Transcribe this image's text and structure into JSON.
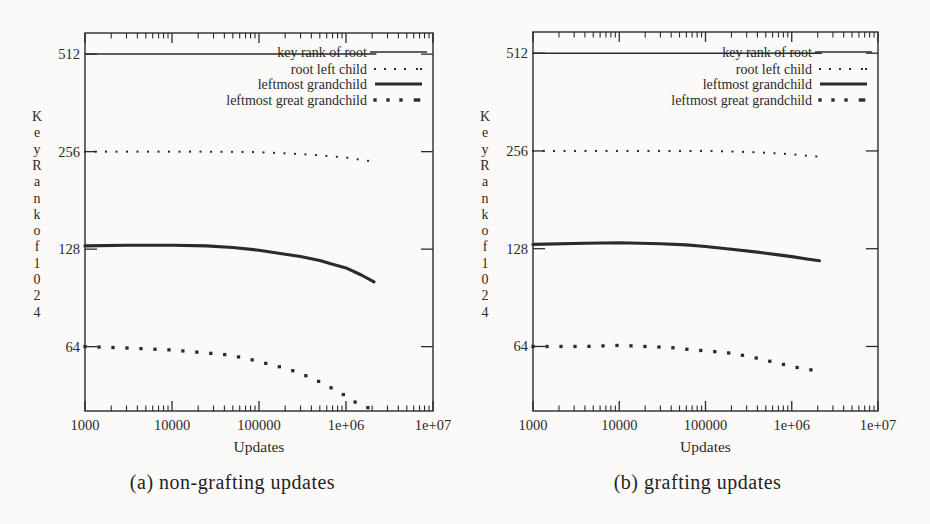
{
  "figure": {
    "background": "#fbfaf8",
    "ink": "#2b2b2b"
  },
  "chart_data": [
    {
      "type": "line",
      "caption": "(a) non-grafting updates",
      "xlabel": "Updates",
      "ylabel": "Key Rank of 1024",
      "x_scale": "log10",
      "y_scale": "log2",
      "xlim": [
        1000,
        10000000
      ],
      "ylim": [
        40.5,
        595
      ],
      "grid": false,
      "legend_position": "top-right-inside",
      "x_ticks": [
        {
          "v": 1000,
          "label": "1000"
        },
        {
          "v": 10000,
          "label": "10000"
        },
        {
          "v": 100000,
          "label": "100000"
        },
        {
          "v": 1000000,
          "label": "1e+06"
        },
        {
          "v": 10000000,
          "label": "1e+07"
        }
      ],
      "y_ticks": [
        {
          "v": 512,
          "label": "512"
        },
        {
          "v": 256,
          "label": "256"
        },
        {
          "v": 128,
          "label": "128"
        },
        {
          "v": 64,
          "label": "64"
        }
      ],
      "series": [
        {
          "name": "key rank of root",
          "style": "line-thin",
          "points": [
            [
              1000,
              512
            ],
            [
              2200000,
              512
            ]
          ]
        },
        {
          "name": "root left child",
          "style": "dots-small",
          "points": [
            [
              1000,
              256
            ],
            [
              20000,
              256
            ],
            [
              60000,
              255.5
            ],
            [
              100000,
              255
            ],
            [
              200000,
              253
            ],
            [
              400000,
              250.5
            ],
            [
              700000,
              247.5
            ],
            [
              1000000,
              245.5
            ],
            [
              1500000,
              241.5
            ],
            [
              2200000,
              238
            ]
          ]
        },
        {
          "name": "leftmost grandchild",
          "style": "line-thick",
          "points": [
            [
              1000,
              131
            ],
            [
              3000,
              131.5
            ],
            [
              10000,
              131.5
            ],
            [
              25000,
              131
            ],
            [
              50000,
              129.5
            ],
            [
              100000,
              127
            ],
            [
              200000,
              123.5
            ],
            [
              300000,
              121.5
            ],
            [
              500000,
              118
            ],
            [
              700000,
              115
            ],
            [
              1000000,
              112
            ],
            [
              1500000,
              106.5
            ],
            [
              2100000,
              101.5
            ]
          ]
        },
        {
          "name": "leftmost great grandchild",
          "style": "dots-large",
          "points": [
            [
              1000,
              64
            ],
            [
              2500,
              63.5
            ],
            [
              5000,
              63
            ],
            [
              10000,
              62.5
            ],
            [
              20000,
              61.5
            ],
            [
              40000,
              60.5
            ],
            [
              70000,
              59
            ],
            [
              100000,
              57.5
            ],
            [
              150000,
              56
            ],
            [
              220000,
              54.5
            ],
            [
              320000,
              52.5
            ],
            [
              450000,
              50.5
            ],
            [
              650000,
              48
            ],
            [
              900000,
              45.8
            ],
            [
              1200000,
              43.5
            ],
            [
              1600000,
              41.8
            ],
            [
              2100000,
              41
            ]
          ]
        }
      ]
    },
    {
      "type": "line",
      "caption": "(b) grafting updates",
      "xlabel": "Updates",
      "ylabel": "Key Rank of 1024",
      "x_scale": "log10",
      "y_scale": "log2",
      "xlim": [
        1000,
        10000000
      ],
      "ylim": [
        40.5,
        595
      ],
      "grid": false,
      "legend_position": "top-right-inside",
      "x_ticks": [
        {
          "v": 1000,
          "label": "1000"
        },
        {
          "v": 10000,
          "label": "10000"
        },
        {
          "v": 100000,
          "label": "100000"
        },
        {
          "v": 1000000,
          "label": "1e+06"
        },
        {
          "v": 10000000,
          "label": "1e+07"
        }
      ],
      "y_ticks": [
        {
          "v": 512,
          "label": "512"
        },
        {
          "v": 256,
          "label": "256"
        },
        {
          "v": 128,
          "label": "128"
        },
        {
          "v": 64,
          "label": "64"
        }
      ],
      "series": [
        {
          "name": "key rank of root",
          "style": "line-thin",
          "points": [
            [
              1000,
              512
            ],
            [
              2200000,
              512
            ]
          ]
        },
        {
          "name": "root left child",
          "style": "dots-small",
          "points": [
            [
              1000,
              256
            ],
            [
              100000,
              256
            ],
            [
              200000,
              255
            ],
            [
              400000,
              253.5
            ],
            [
              700000,
              251.5
            ],
            [
              1000000,
              250
            ],
            [
              1500000,
              247.5
            ],
            [
              2200000,
              245.5
            ]
          ]
        },
        {
          "name": "leftmost grandchild",
          "style": "line-thick",
          "points": [
            [
              1000,
              132
            ],
            [
              4000,
              133
            ],
            [
              10000,
              133.5
            ],
            [
              30000,
              132.5
            ],
            [
              60000,
              131.5
            ],
            [
              100000,
              130
            ],
            [
              200000,
              127.5
            ],
            [
              400000,
              125
            ],
            [
              700000,
              122.5
            ],
            [
              1000000,
              121
            ],
            [
              1500000,
              119
            ],
            [
              2100000,
              117.5
            ]
          ]
        },
        {
          "name": "leftmost great grandchild",
          "style": "dots-large",
          "points": [
            [
              1000,
              64
            ],
            [
              4000,
              64
            ],
            [
              10000,
              64.5
            ],
            [
              20000,
              64
            ],
            [
              40000,
              63.5
            ],
            [
              70000,
              62.5
            ],
            [
              120000,
              61.8
            ],
            [
              200000,
              61
            ],
            [
              300000,
              59.8
            ],
            [
              450000,
              58.5
            ],
            [
              650000,
              57
            ],
            [
              900000,
              56
            ],
            [
              1200000,
              55
            ],
            [
              1600000,
              54.3
            ],
            [
              2100000,
              53.8
            ]
          ]
        }
      ]
    }
  ]
}
